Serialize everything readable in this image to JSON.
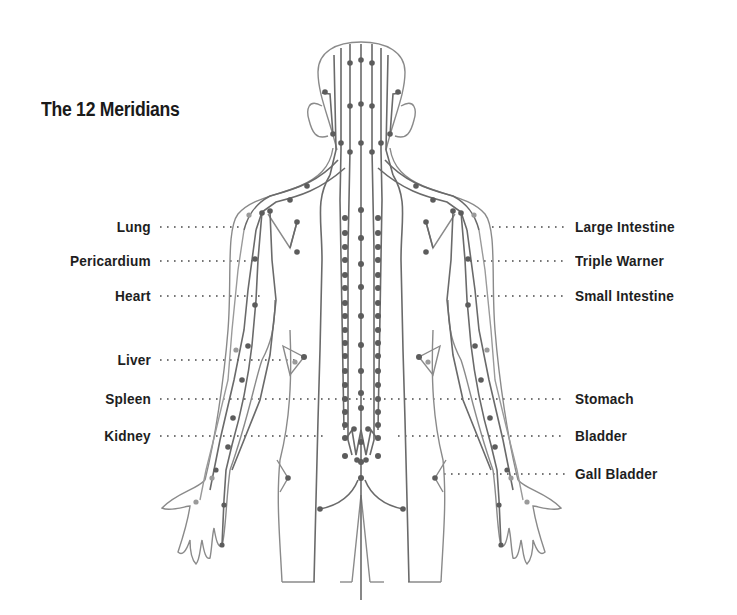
{
  "diagram": {
    "title": "The 12 Meridians",
    "left_labels": [
      {
        "label": "Lung",
        "y": 227
      },
      {
        "label": "Pericardium",
        "y": 261
      },
      {
        "label": "Heart",
        "y": 296
      },
      {
        "label": "Liver",
        "y": 360
      },
      {
        "label": "Spleen",
        "y": 399
      },
      {
        "label": "Kidney",
        "y": 436
      }
    ],
    "right_labels": [
      {
        "label": "Large Intestine",
        "y": 227
      },
      {
        "label": "Triple Warner",
        "y": 261
      },
      {
        "label": "Small Intestine",
        "y": 296
      },
      {
        "label": "Stomach",
        "y": 399
      },
      {
        "label": "Bladder",
        "y": 436
      },
      {
        "label": "Gall Bladder",
        "y": 474
      }
    ],
    "colors": {
      "text": "#1e1e1e",
      "outline": "#8a8a8a",
      "meridian": "#666666",
      "point": "#5a5a5a",
      "leader": "#444444"
    }
  }
}
